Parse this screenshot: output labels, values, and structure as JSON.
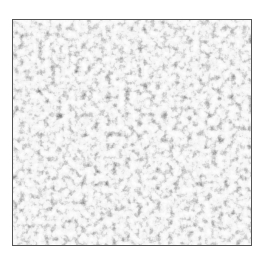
{
  "image": {
    "description": "Grayscale speckled noise texture inside a thin dark border",
    "colors": {
      "background": "#ffffff",
      "border": "#555555",
      "dark_speckle": "#1a1a1a",
      "light_area": "#f0f0f0"
    }
  }
}
